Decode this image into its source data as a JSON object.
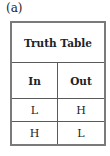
{
  "figure_label": "(a)",
  "table": {
    "title": "Truth Table",
    "headers": [
      "In",
      "Out"
    ],
    "rows": [
      [
        "L",
        "H"
      ],
      [
        "H",
        "L"
      ]
    ]
  }
}
